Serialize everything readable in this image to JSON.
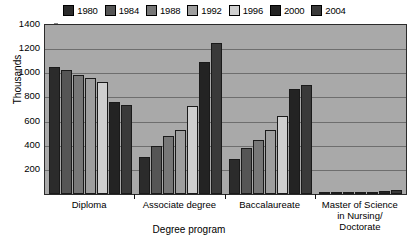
{
  "chart_data": {
    "type": "bar",
    "title": "",
    "xlabel": "Degree program",
    "ylabel": "Thousands",
    "ylim": [
      0,
      1400
    ],
    "ytick_step": 200,
    "yticks": [
      0,
      200,
      400,
      600,
      800,
      1000,
      1200,
      1400
    ],
    "ytick_labels": [
      "",
      "200",
      "400",
      "600",
      "800",
      "1000",
      "1200",
      "1400"
    ],
    "grid": true,
    "legend_position": "top",
    "categories": [
      "Diploma",
      "Associate degree",
      "Baccalaureate",
      "Master of Science in Nursing/ Doctorate"
    ],
    "series": [
      {
        "name": "1980",
        "color": "#2b2b2b",
        "values": [
          1050,
          310,
          290,
          5
        ]
      },
      {
        "name": "1984",
        "color": "#555555",
        "values": [
          1030,
          400,
          380,
          8
        ]
      },
      {
        "name": "1988",
        "color": "#777777",
        "values": [
          990,
          480,
          450,
          10
        ]
      },
      {
        "name": "1992",
        "color": "#9e9e9e",
        "values": [
          960,
          530,
          530,
          12
        ]
      },
      {
        "name": "1996",
        "color": "#cfcfcf",
        "values": [
          930,
          730,
          650,
          15
        ]
      },
      {
        "name": "2000",
        "color": "#232323",
        "values": [
          760,
          1090,
          870,
          25
        ]
      },
      {
        "name": "2004",
        "color": "#3a3a3a",
        "values": [
          740,
          1250,
          900,
          30
        ]
      }
    ]
  },
  "axis": {
    "y_title": "Thousands",
    "x_title": "Degree program"
  },
  "category_lines": [
    [
      "Diploma"
    ],
    [
      "Associate degree"
    ],
    [
      "Baccalaureate"
    ],
    [
      "Master of Science",
      "in Nursing/",
      "Doctorate"
    ]
  ],
  "colors": {
    "plot_background": "#a9a9a9",
    "gridline": "#6e6e6e",
    "axis_line": "#2b2b2b",
    "page_background": "#ffffff",
    "text": "#000000"
  }
}
